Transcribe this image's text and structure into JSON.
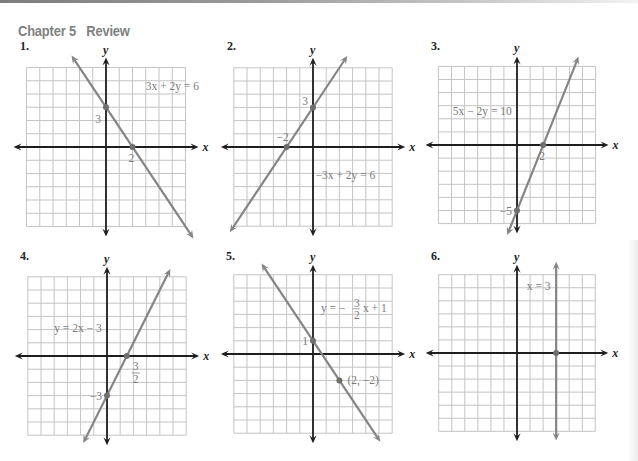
{
  "header": {
    "chapter": "Chapter 5",
    "section": "Review"
  },
  "colors": {
    "header_text": "#7f7f7f",
    "grid": "#c4c4c4",
    "axis": "#1e1e1e",
    "graph_line": "#858585",
    "label_text": "#7a7a7a"
  },
  "chart_data": [
    {
      "type": "line",
      "problem_number": "1.",
      "title": "",
      "equation": "3x + 2y = 6",
      "xlabel": "x",
      "ylabel": "y",
      "xlim": [
        -6,
        6
      ],
      "ylim": [
        -6,
        6
      ],
      "grid": true,
      "line": {
        "slope": -1.5,
        "intercept": 3,
        "x_range": [
          -2.6,
          6.6
        ]
      },
      "points": [
        {
          "x": 0,
          "y": 3,
          "label": "3"
        },
        {
          "x": 2,
          "y": 0,
          "label": "2"
        }
      ],
      "layout": {
        "ox": 106,
        "oy": 147,
        "unit": 13.25,
        "num_x": 20,
        "num_y": 50,
        "eq_x": 3.0,
        "eq_y": 4.3
      }
    },
    {
      "type": "line",
      "problem_number": "2.",
      "title": "",
      "equation": "−3x + 2y = 6",
      "xlabel": "x",
      "ylabel": "y",
      "xlim": [
        -6,
        6
      ],
      "ylim": [
        -6,
        6
      ],
      "grid": true,
      "line": {
        "slope": 1.5,
        "intercept": 3,
        "x_range": [
          -6.3,
          2.6
        ]
      },
      "points": [
        {
          "x": -2,
          "y": 0,
          "label": "−2"
        },
        {
          "x": 0,
          "y": 3,
          "label": "3"
        }
      ],
      "layout": {
        "ox": 313,
        "oy": 147,
        "unit": 13.2,
        "num_x": 227,
        "num_y": 50,
        "eq_x": 0.2,
        "eq_y": -2.4
      }
    },
    {
      "type": "line",
      "problem_number": "3.",
      "title": "",
      "equation": "5x − 2y = 10",
      "xlabel": "x",
      "ylabel": "y",
      "xlim": [
        -6,
        6
      ],
      "ylim": [
        -6,
        6
      ],
      "grid": true,
      "line": {
        "slope": 2.5,
        "intercept": -5,
        "x_range": [
          -0.75,
          4.7
        ]
      },
      "points": [
        {
          "x": 2,
          "y": 0,
          "label": "2"
        },
        {
          "x": 0,
          "y": -5,
          "label": "−5"
        }
      ],
      "layout": {
        "ox": 517,
        "oy": 145,
        "unit": 13.1,
        "num_x": 431,
        "num_y": 50,
        "eq_x": -4.9,
        "eq_y": 2.3
      }
    },
    {
      "type": "line",
      "problem_number": "4.",
      "title": "",
      "equation": "y = 2x − 3",
      "xlabel": "x",
      "ylabel": "y",
      "xlim": [
        -6,
        6
      ],
      "ylim": [
        -6,
        6
      ],
      "grid": true,
      "line": {
        "slope": 2,
        "intercept": -3,
        "x_range": [
          -1.8,
          4.8
        ]
      },
      "points": [
        {
          "x": 1.5,
          "y": 0,
          "label": "3/2"
        },
        {
          "x": 0,
          "y": -3,
          "label": "−3"
        }
      ],
      "layout": {
        "ox": 107,
        "oy": 356,
        "unit": 13.2,
        "num_x": 20,
        "num_y": 260,
        "eq_x": -4.0,
        "eq_y": 1.8
      }
    },
    {
      "type": "line",
      "problem_number": "5.",
      "title": "",
      "equation": "y = −(3/2)x + 1",
      "xlabel": "x",
      "ylabel": "y",
      "xlim": [
        -6,
        6
      ],
      "ylim": [
        -6,
        6
      ],
      "grid": true,
      "line": {
        "slope": -1.5,
        "intercept": 1,
        "x_range": [
          -3.9,
          5.1
        ]
      },
      "points": [
        {
          "x": 0,
          "y": 1,
          "label": "1"
        },
        {
          "x": 2,
          "y": -2,
          "label": "(2, −2)"
        }
      ],
      "layout": {
        "ox": 313,
        "oy": 354,
        "unit": 13.2,
        "num_x": 226,
        "num_y": 260,
        "eq_x": 0.6,
        "eq_y": 3.2
      }
    },
    {
      "type": "line",
      "problem_number": "6.",
      "title": "",
      "equation": "x = 3",
      "xlabel": "x",
      "ylabel": "y",
      "xlim": [
        -6,
        6
      ],
      "ylim": [
        -6,
        6
      ],
      "grid": true,
      "line": {
        "vertical_x": 3,
        "y_range": [
          -6.7,
          7.0
        ]
      },
      "points": [
        {
          "x": 3,
          "y": 0,
          "label": ""
        }
      ],
      "layout": {
        "ox": 517,
        "oy": 353,
        "unit": 13.05,
        "num_x": 431,
        "num_y": 260,
        "eq_x": 0.75,
        "eq_y": 4.8
      }
    }
  ]
}
